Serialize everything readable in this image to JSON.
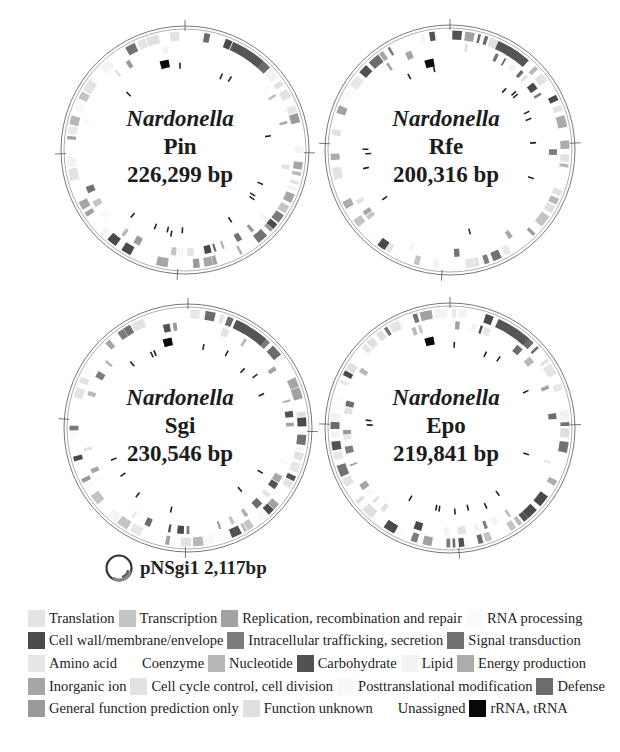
{
  "genomes": [
    {
      "id": "pin",
      "genus": "Nardonella",
      "strain": "Pin",
      "size": "226,299 bp",
      "cx": 185,
      "cy": 150,
      "r": 124,
      "seed": 11
    },
    {
      "id": "rfe",
      "genus": "Nardonella",
      "strain": "Rfe",
      "size": "200,316 bp",
      "cx": 450,
      "cy": 150,
      "r": 125,
      "seed": 23
    },
    {
      "id": "sgi",
      "genus": "Nardonella",
      "strain": "Sgi",
      "size": "230,546 bp",
      "cx": 188,
      "cy": 428,
      "r": 124,
      "seed": 37
    },
    {
      "id": "epo",
      "genus": "Nardonella",
      "strain": "Epo",
      "size": "219,841 bp",
      "cx": 450,
      "cy": 428,
      "r": 125,
      "seed": 53
    }
  ],
  "plasmid": {
    "label": "pNSgi1 2,117bp"
  },
  "legend": {
    "rows": [
      [
        {
          "label": "Translation",
          "color": "#e4e4e4"
        },
        {
          "label": "Transcription",
          "color": "#c4c4c4"
        },
        {
          "label": "Replication, recombination and repair",
          "color": "#a2a2a2"
        },
        {
          "label": "RNA processing",
          "color": "#fbfbfb"
        }
      ],
      [
        {
          "label": "Cell wall/membrane/envelope",
          "color": "#4a4a4a"
        },
        {
          "label": "Intracellular trafficking, secretion",
          "color": "#7c7c7c"
        },
        {
          "label": "Signal transduction",
          "color": "#727272"
        }
      ],
      [
        {
          "label": "Amino acid",
          "color": "#e7e7e7"
        },
        {
          "label": "Coenzyme",
          "color": "#ffffff"
        },
        {
          "label": "Nucleotide",
          "color": "#b8b8b8"
        },
        {
          "label": "Carbohydrate",
          "color": "#525252"
        },
        {
          "label": "Lipid",
          "color": "#f3f3f3"
        },
        {
          "label": "Energy production",
          "color": "#acacac"
        }
      ],
      [
        {
          "label": "Inorganic ion",
          "color": "#a6a6a6"
        },
        {
          "label": "Cell cycle control, cell division",
          "color": "#e2e2e2"
        },
        {
          "label": "Posttranslational modification",
          "color": "#f8f8f8"
        },
        {
          "label": "Defense",
          "color": "#6c6c6c"
        }
      ],
      [
        {
          "label": "General function prediction only",
          "color": "#9a9a9a"
        },
        {
          "label": "Function unknown",
          "color": "#e0e0e0"
        },
        {
          "label": "Unassigned",
          "color": "#ffffff"
        },
        {
          "label": "rRNA, tRNA",
          "color": "#080808"
        }
      ]
    ]
  }
}
